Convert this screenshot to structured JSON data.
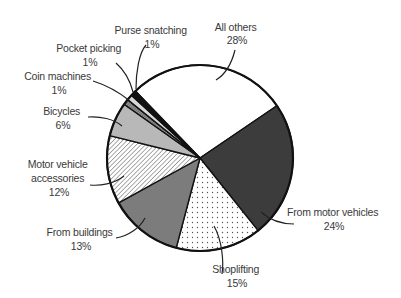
{
  "chart_data": {
    "type": "pie",
    "title": "",
    "start_angle_deg": -44,
    "direction": "clockwise",
    "slices": [
      {
        "label": "All others",
        "value": 28,
        "value_label": "28%",
        "fill": "#ffffff",
        "pattern": "none"
      },
      {
        "label": "From motor vehicles",
        "value": 24,
        "value_label": "24%",
        "fill": "#3c3c3c",
        "pattern": "none"
      },
      {
        "label": "Shoplifting",
        "value": 15,
        "value_label": "15%",
        "fill": "#ffffff",
        "pattern": "dots"
      },
      {
        "label": "From buildings",
        "value": 13,
        "value_label": "13%",
        "fill": "#7c7c7c",
        "pattern": "none"
      },
      {
        "label": "Motor vehicle accessories",
        "value": 12,
        "value_label": "12%",
        "fill": "#ffffff",
        "pattern": "hatch"
      },
      {
        "label": "Bicycles",
        "value": 6,
        "value_label": "6%",
        "fill": "#b8b8b8",
        "pattern": "none"
      },
      {
        "label": "Coin machines",
        "value": 1,
        "value_label": "1%",
        "fill": "#8a8a8a",
        "pattern": "hatch"
      },
      {
        "label": "Pocket picking",
        "value": 1,
        "value_label": "1%",
        "fill": "#d8d8d8",
        "pattern": "none"
      },
      {
        "label": "Purse snatching",
        "value": 1,
        "value_label": "1%",
        "fill": "#111111",
        "pattern": "none"
      }
    ],
    "legend": "none (leader-line labels)"
  },
  "labels": {
    "all_others": {
      "lines": [
        "All others",
        "28%"
      ]
    },
    "from_motor_vehicles": {
      "lines": [
        "From motor vehicles",
        "24%"
      ]
    },
    "shoplifting": {
      "lines": [
        "Shoplifting",
        "15%"
      ]
    },
    "from_buildings": {
      "lines": [
        "From buildings",
        "13%"
      ]
    },
    "motor_vehicle_accessories": {
      "lines": [
        "Motor vehicle",
        "accessories",
        "12%"
      ]
    },
    "bicycles": {
      "lines": [
        "Bicycles",
        "6%"
      ]
    },
    "coin_machines": {
      "lines": [
        "Coin machines",
        "1%"
      ]
    },
    "pocket_picking": {
      "lines": [
        "Pocket picking",
        "1%"
      ]
    },
    "purse_snatching": {
      "lines": [
        "Purse snatching",
        "1%"
      ]
    }
  }
}
